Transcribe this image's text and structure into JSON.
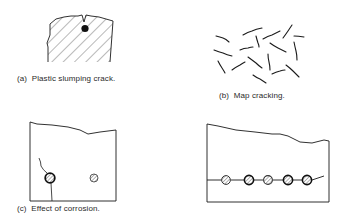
{
  "figures": {
    "a": {
      "caption": "(a)  Plastic slumping crack.",
      "description": "Hatched concrete section with V-notch crack at top and reinforcing bar below crack"
    },
    "b": {
      "caption": "(b)  Map cracking.",
      "description": "Random short crack segments in a map pattern"
    },
    "c": {
      "caption": "(c)  Effect of corrosion.",
      "description": "Concrete section with corroded bar cracking cover, and a sound bar",
      "bars": [
        {
          "label": "corroded bar",
          "corroded": true
        },
        {
          "label": "sound bar",
          "corroded": false
        }
      ]
    },
    "d": {
      "caption": "",
      "description": "Concrete section with horizontal delamination crack linking a row of five bars",
      "bars_count": 5
    }
  },
  "colors": {
    "ink": "#1a1a1a",
    "background": "#ffffff"
  }
}
